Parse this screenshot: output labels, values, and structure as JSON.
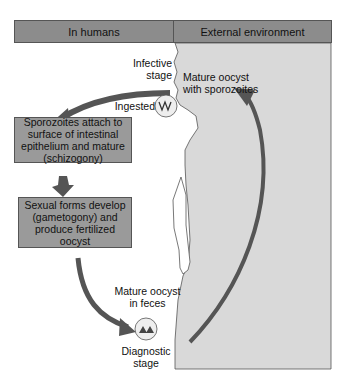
{
  "header": {
    "left_label": "In humans",
    "right_label": "External environment"
  },
  "labels": {
    "infective_stage": "Infective\nstage",
    "mature_oocyst_sporozoites": "Mature oocyst\nwith sporozoites",
    "ingested": "Ingested",
    "mature_oocyst_feces": "Mature oocyst\nin feces",
    "diagnostic_stage": "Diagnostic\nstage"
  },
  "boxes": {
    "schizogony": "Sporozoites attach to surface of intestinal epithelium and mature (schizogony)",
    "gametogony": "Sexual forms develop (gametogony) and produce fertilized oocyst"
  },
  "colors": {
    "header_fill": "#8c8c8c",
    "external_fill": "#d9d9d9",
    "box_fill": "#9a9a9a",
    "arrow_fill": "#555555",
    "outline": "#555555"
  }
}
